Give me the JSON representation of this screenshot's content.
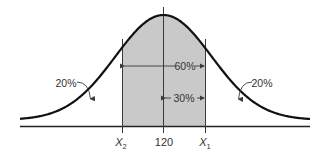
{
  "diagram": {
    "type": "normal-distribution",
    "mean": 120,
    "colors": {
      "curve": "#111111",
      "shade": "#c9c9c9",
      "lines": "#3a3a3a",
      "text": "#333333"
    },
    "regions": {
      "shaded_label": "60%",
      "half_label": "30%",
      "left_tail_label": "20%",
      "right_tail_label": "20%"
    },
    "x_axis": {
      "ticks": [
        {
          "label": "X",
          "subscript": "2",
          "italic": true
        },
        {
          "label": "120",
          "subscript": "",
          "italic": false
        },
        {
          "label": "X",
          "subscript": "1",
          "italic": true
        }
      ]
    }
  }
}
